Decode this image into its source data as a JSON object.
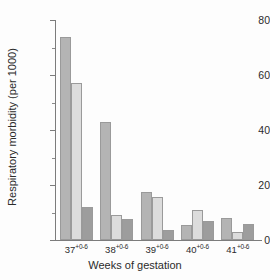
{
  "chart_data": {
    "type": "bar",
    "title": "",
    "xlabel": "Weeks of gestation",
    "ylabel": "Respiratory morbidity (per 1000)",
    "categories": [
      "37+0-6",
      "38+0-6",
      "39+0-6",
      "40+0-6",
      "41+0-6"
    ],
    "category_base": [
      "37",
      "38",
      "39",
      "40",
      "41"
    ],
    "category_superscript": [
      "+0-6",
      "+0-6",
      "+0-6",
      "+0-6",
      "+0-6"
    ],
    "series": [
      {
        "name": "series-1",
        "color": "#b4b4b4",
        "values": [
          74,
          43,
          17.5,
          5.5,
          8
        ]
      },
      {
        "name": "series-2",
        "color": "#dcdcdc",
        "values": [
          57,
          9,
          15.5,
          11,
          3
        ]
      },
      {
        "name": "series-3",
        "color": "#9d9d9d",
        "values": [
          12,
          7.5,
          3.5,
          7,
          6
        ]
      }
    ],
    "ylim": [
      0,
      80
    ],
    "ytick_labels": [
      "0",
      "20",
      "40",
      "60",
      "80"
    ],
    "ytick_values": [
      0,
      20,
      40,
      60,
      80
    ],
    "yminor_values": [
      10,
      30,
      50,
      70
    ],
    "grid": false,
    "legend": "none"
  }
}
